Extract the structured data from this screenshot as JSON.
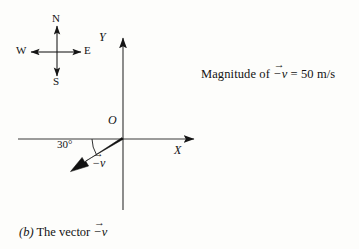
{
  "figure": {
    "caption_prefix": "(b)",
    "caption_text": "The vector",
    "caption_vector": "−v",
    "background_color": "#fdfdfb",
    "ink_color": "#131313"
  },
  "compass": {
    "center": {
      "x": 57,
      "y": 52
    },
    "north_label": "N",
    "south_label": "S",
    "east_label": "E",
    "west_label": "W"
  },
  "axes": {
    "origin_label": "O",
    "x_label": "X",
    "y_label": "Y",
    "origin": {
      "x": 123,
      "y": 139
    },
    "x_min": 18,
    "x_max": 200,
    "y_top": 33,
    "y_bottom": 210
  },
  "vector": {
    "symbol": "−v",
    "angle_label": "30°",
    "angle_degrees": 30,
    "direction": "below negative X axis (third quadrant, pointing down-left)",
    "tip": {
      "x": 73,
      "y": 169
    }
  },
  "annotation": {
    "magnitude_prefix": "Magnitude of",
    "magnitude_vector": "−v",
    "magnitude_equals": "=",
    "magnitude_value": "50",
    "magnitude_units": "m/s",
    "full_text": "Magnitude of −v = 50 m/s"
  }
}
